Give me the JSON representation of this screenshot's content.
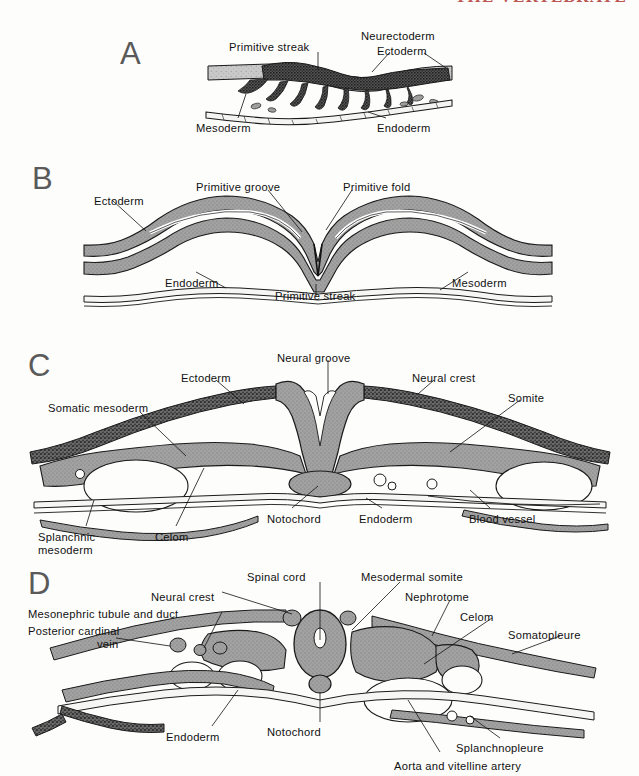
{
  "header": {
    "running_head": "THE VERTEBRATE"
  },
  "figure": {
    "background_color": "#fdfdfc",
    "ink_color": "#111111",
    "panel_letter_color": "#5a5a5a",
    "tissue_fill_gray": "#999999",
    "tissue_fill_dark": "#4a4a4a",
    "outline_color": "#1a1a1a"
  },
  "panels": [
    {
      "id": "A",
      "letter": "A",
      "caption_title": "Primitive streak stage",
      "labels": [
        {
          "text": "Primitive streak",
          "x": 229,
          "y": 41,
          "align": "left"
        },
        {
          "text": "Neurectoderm",
          "x": 361,
          "y": 30,
          "align": "left"
        },
        {
          "text": "Ectoderm",
          "x": 377,
          "y": 45,
          "align": "left"
        },
        {
          "text": "Mesoderm",
          "x": 196,
          "y": 122,
          "align": "left"
        },
        {
          "text": "Endoderm",
          "x": 377,
          "y": 122,
          "align": "left"
        }
      ]
    },
    {
      "id": "B",
      "letter": "B",
      "caption_title": "Primitive groove and fold stage",
      "labels": [
        {
          "text": "Ectoderm",
          "x": 94,
          "y": 195,
          "align": "left"
        },
        {
          "text": "Primitive groove",
          "x": 196,
          "y": 181,
          "align": "left"
        },
        {
          "text": "Primitive fold",
          "x": 343,
          "y": 181,
          "align": "left"
        },
        {
          "text": "Endoderm",
          "x": 165,
          "y": 277,
          "align": "left"
        },
        {
          "text": "Primitive streak",
          "x": 275,
          "y": 290,
          "align": "left"
        },
        {
          "text": "Mesoderm",
          "x": 452,
          "y": 277,
          "align": "left"
        }
      ]
    },
    {
      "id": "C",
      "letter": "C",
      "caption_title": "Neural groove and somite stage",
      "labels": [
        {
          "text": "Neural groove",
          "x": 277,
          "y": 352,
          "align": "left"
        },
        {
          "text": "Ectoderm",
          "x": 181,
          "y": 372,
          "align": "left"
        },
        {
          "text": "Neural crest",
          "x": 412,
          "y": 372,
          "align": "left"
        },
        {
          "text": "Somite",
          "x": 508,
          "y": 392,
          "align": "left"
        },
        {
          "text": "Somatic mesoderm",
          "x": 48,
          "y": 402,
          "align": "left"
        },
        {
          "text": "Notochord",
          "x": 267,
          "y": 513,
          "align": "left"
        },
        {
          "text": "Endoderm",
          "x": 359,
          "y": 513,
          "align": "left"
        },
        {
          "text": "Blood vessel",
          "x": 469,
          "y": 513,
          "align": "left"
        },
        {
          "text": "Splanchnic",
          "x": 38,
          "y": 531,
          "align": "left"
        },
        {
          "text": "mesoderm",
          "x": 38,
          "y": 544,
          "align": "left"
        },
        {
          "text": "Celom",
          "x": 155,
          "y": 531,
          "align": "left"
        }
      ]
    },
    {
      "id": "D",
      "letter": "D",
      "caption_title": "Neural tube, somite and nephrotome stage",
      "labels": [
        {
          "text": "Spinal cord",
          "x": 247,
          "y": 571,
          "align": "left"
        },
        {
          "text": "Mesodermal somite",
          "x": 361,
          "y": 571,
          "align": "left"
        },
        {
          "text": "Neural crest",
          "x": 151,
          "y": 591,
          "align": "left"
        },
        {
          "text": "Nephrotome",
          "x": 405,
          "y": 591,
          "align": "left"
        },
        {
          "text": "Mesonephric tubule and duct",
          "x": 28,
          "y": 608,
          "align": "left"
        },
        {
          "text": "Celom",
          "x": 460,
          "y": 611,
          "align": "left"
        },
        {
          "text": "Posterior cardinal",
          "x": 28,
          "y": 625,
          "align": "left"
        },
        {
          "text": "vein",
          "x": 97,
          "y": 638,
          "align": "left"
        },
        {
          "text": "Somatopleure",
          "x": 508,
          "y": 629,
          "align": "left"
        },
        {
          "text": "Endoderm",
          "x": 166,
          "y": 731,
          "align": "left"
        },
        {
          "text": "Notochord",
          "x": 267,
          "y": 726,
          "align": "left"
        },
        {
          "text": "Splanchnopleure",
          "x": 456,
          "y": 742,
          "align": "left"
        },
        {
          "text": "Aorta and vitelline artery",
          "x": 394,
          "y": 760,
          "align": "left"
        }
      ]
    }
  ]
}
